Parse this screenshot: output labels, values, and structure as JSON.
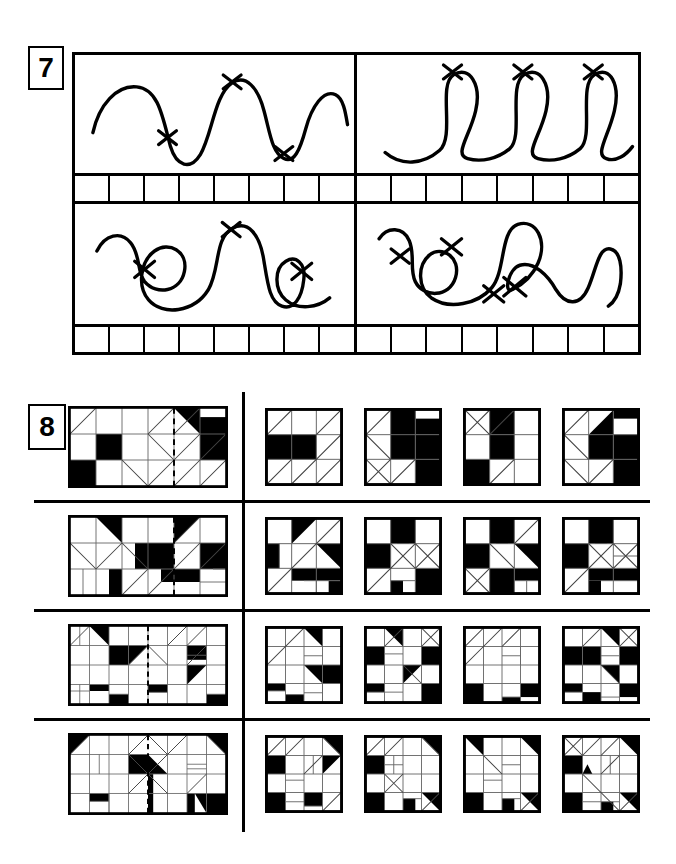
{
  "worksheet": {
    "exercises": [
      {
        "number": "7",
        "type": "curve-tracing-cross-counting",
        "panels": [
          {
            "id": "7a",
            "position": "top-left",
            "figure": "wavy-line-with-three-crossing-marks",
            "crosses": 3,
            "answer_boxes": 8
          },
          {
            "id": "7b",
            "position": "top-right",
            "figure": "three-loops-with-three-crossing-marks",
            "crosses": 3,
            "answer_boxes": 8
          },
          {
            "id": "7c",
            "position": "bottom-left",
            "figure": "loop-wave-loop-with-three-crossing-marks",
            "crosses": 3,
            "answer_boxes": 8
          },
          {
            "id": "7d",
            "position": "bottom-right",
            "figure": "double-loop-wave-with-four-crossing-marks",
            "crosses": 4,
            "answer_boxes": 8
          }
        ]
      },
      {
        "number": "8",
        "type": "mirror-symmetry-pattern-matching",
        "rows": [
          {
            "id": "8-1",
            "stem": "3x6-grid-with-dashed-mirror-axis",
            "options": 4
          },
          {
            "id": "8-2",
            "stem": "3x6-grid-with-dashed-mirror-axis",
            "options": 4
          },
          {
            "id": "8-3",
            "stem": "4x8-grid-with-dashed-mirror-axis",
            "options": 4
          },
          {
            "id": "8-4",
            "stem": "4x8-grid-with-dashed-mirror-axis",
            "options": 4
          }
        ]
      }
    ]
  },
  "colors": {
    "ink": "#000000",
    "paper": "#ffffff",
    "grid_line": "#555555"
  }
}
